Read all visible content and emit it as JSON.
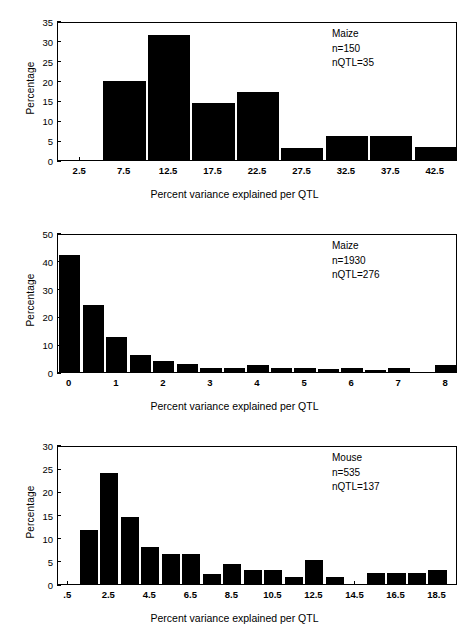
{
  "figure": {
    "background": "#ffffff",
    "bar_color": "#000000",
    "axis_color": "#000000"
  },
  "panels": [
    {
      "id": "panel-maize-150",
      "annotation": {
        "species": "Maize",
        "n": "n=150",
        "nqtl": "nQTL=35"
      },
      "chart_data": {
        "type": "bar",
        "title": "",
        "xlabel": "Percent variance explained per QTL",
        "ylabel": "Percentage",
        "ylim": [
          0,
          35
        ],
        "yticks": [
          0,
          5,
          10,
          15,
          20,
          25,
          30,
          35
        ],
        "ytick_labels": [
          "0",
          "5",
          "10",
          "15",
          "20",
          "25",
          "30",
          "35"
        ],
        "xlim": [
          0,
          45
        ],
        "xticks": [
          2.5,
          7.5,
          12.5,
          17.5,
          22.5,
          27.5,
          32.5,
          37.5,
          42.5
        ],
        "xtick_labels": [
          "2.5",
          "7.5",
          "12.5",
          "17.5",
          "22.5",
          "27.5",
          "32.5",
          "37.5",
          "42.5"
        ],
        "bin_width": 5,
        "categories": [
          2.5,
          7.5,
          12.5,
          17.5,
          22.5,
          27.5,
          32.5,
          37.5,
          42.5
        ],
        "values": [
          0,
          20.0,
          31.5,
          14.4,
          17.2,
          3.0,
          6.0,
          6.0,
          3.2
        ],
        "grid": false,
        "legend": "none"
      }
    },
    {
      "id": "panel-maize-1930",
      "annotation": {
        "species": "Maize",
        "n": "n=1930",
        "nqtl": "nQTL=276"
      },
      "chart_data": {
        "type": "bar",
        "title": "",
        "xlabel": "Percent variance explained per QTL",
        "ylabel": "Percentage",
        "ylim": [
          0,
          50
        ],
        "yticks": [
          0,
          10,
          20,
          30,
          40,
          50
        ],
        "ytick_labels": [
          "0",
          "10",
          "20",
          "30",
          "40",
          "50"
        ],
        "xlim": [
          -0.25,
          8.25
        ],
        "xticks": [
          0,
          1,
          2,
          3,
          4,
          5,
          6,
          7,
          8
        ],
        "xtick_labels": [
          "0",
          "1",
          "2",
          "3",
          "4",
          "5",
          "6",
          "7",
          "8"
        ],
        "bin_width": 0.5,
        "categories": [
          0,
          0.5,
          1,
          1.5,
          2,
          2.5,
          3,
          3.5,
          4,
          4.5,
          5,
          5.5,
          6,
          6.5,
          7,
          7.5,
          8
        ],
        "values": [
          42.0,
          24.0,
          12.5,
          6.0,
          4.0,
          3.0,
          1.5,
          1.5,
          2.4,
          1.6,
          1.5,
          1.0,
          1.3,
          0.9,
          1.3,
          0.0,
          2.5
        ],
        "grid": false,
        "legend": "none"
      }
    },
    {
      "id": "panel-mouse-535",
      "annotation": {
        "species": "Mouse",
        "n": "n=535",
        "nqtl": "nQTL=137"
      },
      "chart_data": {
        "type": "bar",
        "title": "",
        "xlabel": "Percent variance explained per QTL",
        "ylabel": "Percentage",
        "ylim": [
          0,
          30
        ],
        "yticks": [
          0,
          5,
          10,
          15,
          20,
          25,
          30
        ],
        "ytick_labels": [
          "0",
          "5",
          "10",
          "15",
          "20",
          "25",
          "30"
        ],
        "xlim": [
          0,
          19.5
        ],
        "xticks": [
          0.5,
          2.5,
          4.5,
          6.5,
          8.5,
          10.5,
          12.5,
          14.5,
          16.5,
          18.5
        ],
        "xtick_labels": [
          ".5",
          "2.5",
          "4.5",
          "6.5",
          "8.5",
          "10.5",
          "12.5",
          "14.5",
          "16.5",
          "18.5"
        ],
        "bin_width": 1,
        "categories": [
          0.5,
          1.5,
          2.5,
          3.5,
          4.5,
          5.5,
          6.5,
          7.5,
          8.5,
          9.5,
          10.5,
          11.5,
          12.5,
          13.5,
          14.5,
          15.5,
          16.5,
          17.5,
          18.5
        ],
        "values": [
          0,
          11.6,
          24.0,
          14.5,
          8.0,
          6.5,
          6.5,
          2.2,
          4.3,
          3.0,
          3.0,
          1.5,
          5.2,
          1.5,
          0,
          2.3,
          2.3,
          2.3,
          3.1
        ],
        "grid": false,
        "legend": "none"
      }
    }
  ]
}
